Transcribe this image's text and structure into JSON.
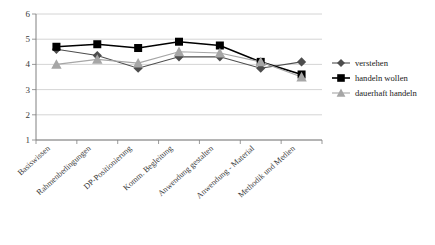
{
  "chart_data": {
    "type": "line",
    "title": "",
    "xlabel": "",
    "ylabel": "",
    "ylim": [
      1,
      6
    ],
    "yticks": [
      1,
      2,
      3,
      4,
      5,
      6
    ],
    "grid": true,
    "legend_position": "right",
    "categories": [
      "Basiswissen",
      "Rahmenbedingungen",
      "DP-Positionierung",
      "Komm. Begleitung",
      "Anwendung gestalten",
      "Anwendung - Material",
      "Methodik und Medien"
    ],
    "series": [
      {
        "name": "verstehen",
        "marker": "diamond",
        "color": "#4d4d4d",
        "values": [
          4.6,
          4.35,
          3.85,
          4.3,
          4.3,
          3.85,
          4.1
        ]
      },
      {
        "name": "handeln wollen",
        "marker": "square",
        "color": "#000000",
        "values": [
          4.7,
          4.8,
          4.65,
          4.9,
          4.75,
          4.1,
          3.6
        ]
      },
      {
        "name": "dauerhaft handeln",
        "marker": "triangle",
        "color": "#a6a6a6",
        "values": [
          4.0,
          4.2,
          4.05,
          4.5,
          4.45,
          4.1,
          3.5
        ]
      }
    ]
  },
  "legend": {
    "items": [
      {
        "label": "verstehen",
        "icon": "diamond-marker-icon"
      },
      {
        "label": "handeln wollen",
        "icon": "square-marker-icon"
      },
      {
        "label": "dauerhaft handeln",
        "icon": "triangle-marker-icon"
      }
    ]
  },
  "axes": {
    "y_tick_labels": [
      "6",
      "5",
      "4",
      "3",
      "2",
      "1"
    ],
    "x_tick_labels": [
      "Basiswissen",
      "Rahmenbedingungen",
      "DP-Positionierung",
      "Komm. Begleitung",
      "Anwendung gestalten",
      "Anwendung - Material",
      "Methodik und Medien"
    ]
  },
  "colors": {
    "verstehen": "#4d4d4d",
    "handeln_wollen": "#000000",
    "dauerhaft_handeln": "#a6a6a6",
    "gridline": "#c9c9c9",
    "axis": "#808080",
    "background": "#ffffff"
  }
}
